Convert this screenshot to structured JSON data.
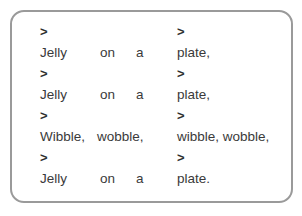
{
  "document": {
    "title": "Jelly on a plate rhyme",
    "border_color": "#9a9a9a",
    "text_color": "#3a3a3a",
    "background_color": "#ffffff",
    "marker": ">",
    "lines": [
      {
        "kind": "marker",
        "left_marker": ">",
        "right_marker": ">"
      },
      {
        "kind": "text",
        "col1": "Jelly",
        "col2": "on",
        "col3": "a",
        "col4": "plate,"
      },
      {
        "kind": "marker",
        "left_marker": ">",
        "right_marker": ">"
      },
      {
        "kind": "text",
        "col1": "Jelly",
        "col2": "on",
        "col3": "a",
        "col4": "plate,"
      },
      {
        "kind": "marker",
        "left_marker": ">",
        "right_marker": ">"
      },
      {
        "kind": "wobble",
        "col1": "Wibble,",
        "col2": "wobble,",
        "col4": "wibble, wobble,"
      },
      {
        "kind": "marker",
        "left_marker": ">",
        "right_marker": ">"
      },
      {
        "kind": "text",
        "col1": "Jelly",
        "col2": "on",
        "col3": "a",
        "col4": "plate."
      }
    ]
  }
}
